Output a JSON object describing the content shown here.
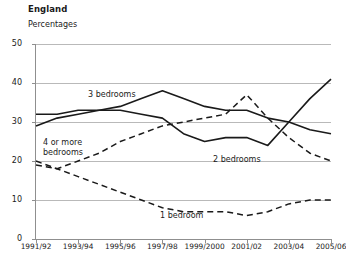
{
  "header": {
    "title": "England",
    "subtitle": "Percentages"
  },
  "chart_data": {
    "type": "line",
    "title": "England",
    "subtitle": "Percentages",
    "xlabel": "",
    "ylabel": "Percentages",
    "ylim": [
      0,
      50
    ],
    "yticks": [
      0,
      10,
      20,
      30,
      40,
      50
    ],
    "grid": true,
    "legend_position": "inline-annotations",
    "x": [
      "1991/92",
      "1992/93",
      "1993/94",
      "1994/95",
      "1995/96",
      "1996/97",
      "1997/98",
      "1998/99",
      "1999/2000",
      "2000/01",
      "2001/02",
      "2002/03",
      "2003/04",
      "2004/05",
      "2005/06"
    ],
    "xtick_labels": [
      "1991/92",
      "1993/94",
      "1995/96",
      "1997/98",
      "1999/2000",
      "2001/02",
      "2003/04",
      "2005/06"
    ],
    "xtick_indices": [
      0,
      2,
      4,
      6,
      8,
      10,
      12,
      14
    ],
    "series": [
      {
        "name": "3 bedrooms",
        "style": "solid",
        "color": "#1a1a1a",
        "values": [
          32,
          32,
          33,
          33,
          34,
          36,
          38,
          36,
          34,
          33,
          33,
          31,
          30,
          28,
          27
        ]
      },
      {
        "name": "2 bedrooms",
        "style": "solid",
        "color": "#1a1a1a",
        "values": [
          29,
          31,
          32,
          33,
          33,
          32,
          31,
          27,
          25,
          26,
          26,
          24,
          30,
          36,
          41
        ]
      },
      {
        "name": "4 or more bedrooms",
        "style": "dashed",
        "color": "#1a1a1a",
        "values": [
          19,
          18,
          20,
          22,
          25,
          27,
          29,
          30,
          31,
          32,
          37,
          31,
          26,
          22,
          20
        ]
      },
      {
        "name": "1 bedroom",
        "style": "dashed",
        "color": "#1a1a1a",
        "values": [
          20,
          18,
          16,
          14,
          12,
          10,
          8,
          7,
          7,
          7,
          6,
          7,
          9,
          10,
          10
        ]
      }
    ],
    "annotations": [
      {
        "text": "3 bedrooms",
        "x": 88,
        "y": 90
      },
      {
        "text": "2 bedrooms",
        "x": 213,
        "y": 155
      },
      {
        "text": "4 or more\nbedrooms",
        "x": 43,
        "y": 138
      },
      {
        "text": "1 bedroom",
        "x": 160,
        "y": 211
      }
    ]
  }
}
